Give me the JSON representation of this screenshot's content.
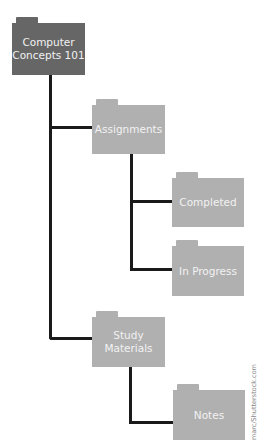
{
  "diagram": {
    "nodes": [
      {
        "id": "root",
        "label": "Computer Concepts 101",
        "level": 0
      },
      {
        "id": "assignments",
        "label": "Assignments",
        "level": 1,
        "parent": "root"
      },
      {
        "id": "completed",
        "label": "Completed",
        "level": 2,
        "parent": "assignments"
      },
      {
        "id": "in_progress",
        "label": "In Progress",
        "level": 2,
        "parent": "assignments"
      },
      {
        "id": "study",
        "label": "Study Materials",
        "level": 1,
        "parent": "root"
      },
      {
        "id": "notes",
        "label": "Notes",
        "level": 2,
        "parent": "study"
      }
    ],
    "colors": {
      "root": "#666666",
      "child": "#b0b0b0",
      "line": "#1a1a1a",
      "text": "#f2f2f2"
    }
  },
  "labels": {
    "root_l1": "Computer",
    "root_l2": "Concepts 101",
    "assignments": "Assignments",
    "completed": "Completed",
    "in_progress": "In Progress",
    "study_l1": "Study",
    "study_l2": "Materials",
    "notes": "Notes"
  },
  "credit": "marc/Shutterstock.com"
}
